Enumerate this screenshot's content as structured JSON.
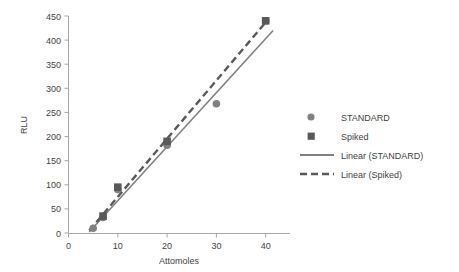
{
  "chart_data": {
    "type": "scatter",
    "title": "",
    "xlabel": "Attomoles",
    "ylabel": "RLU",
    "xlim": [
      0,
      45
    ],
    "ylim": [
      0,
      450
    ],
    "xticks": [
      "0",
      "10",
      "20",
      "30",
      "40"
    ],
    "xtick_values": [
      0,
      10,
      20,
      30,
      40
    ],
    "yticks": [
      "0",
      "50",
      "100",
      "150",
      "200",
      "250",
      "300",
      "350",
      "400",
      "450"
    ],
    "ytick_values": [
      0,
      50,
      100,
      150,
      200,
      250,
      300,
      350,
      400,
      450
    ],
    "grid": false,
    "legend_position": "right",
    "series": [
      {
        "name": "STANDARD",
        "marker": "circle",
        "color": "#808080",
        "x": [
          5,
          7,
          10,
          20,
          30,
          40
        ],
        "values": [
          10,
          32,
          90,
          182,
          268,
          440
        ]
      },
      {
        "name": "Spiked",
        "marker": "square",
        "color": "#595959",
        "x": [
          7,
          10,
          20,
          40
        ],
        "values": [
          35,
          95,
          190,
          440
        ]
      },
      {
        "name": "Linear (STANDARD)",
        "marker": "solid-line",
        "color": "#808080",
        "x": [
          4.2,
          41.5
        ],
        "values": [
          2,
          420
        ]
      },
      {
        "name": "Linear (Spiked)",
        "marker": "dashed-line",
        "color": "#595959",
        "x": [
          4.2,
          40.5
        ],
        "values": [
          5,
          443
        ]
      }
    ]
  },
  "legend": {
    "items": [
      {
        "label": "STANDARD",
        "glyph": "circle-marker-icon"
      },
      {
        "label": "Spiked",
        "glyph": "square-marker-icon"
      },
      {
        "label": "Linear (STANDARD)",
        "glyph": "solid-line-icon"
      },
      {
        "label": "Linear (Spiked)",
        "glyph": "dashed-line-icon"
      }
    ]
  },
  "colors": {
    "standard": "#808080",
    "spiked": "#595959",
    "axis": "#a6a6a6",
    "text": "#3f3f3f",
    "background": "#ffffff"
  }
}
